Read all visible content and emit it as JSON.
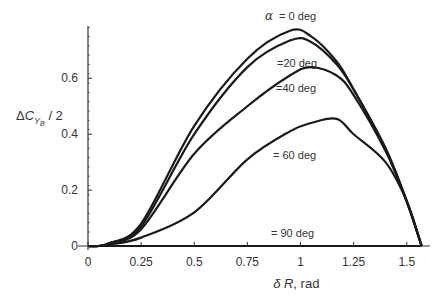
{
  "chart_data": {
    "type": "line",
    "title": "",
    "xlabel": "δR, rad",
    "ylabel": "ΔC_YB / 2",
    "xlim": [
      0,
      1.6
    ],
    "ylim": [
      0,
      0.8
    ],
    "grid": false,
    "legend": "inline curve labels",
    "x_ticks": [
      "0",
      "0.25",
      "0.5",
      "0.75",
      "1",
      "1.25",
      "1.5"
    ],
    "y_ticks": [
      "0",
      "0.2",
      "0.4",
      "0.6"
    ],
    "x": [
      0,
      0.05,
      0.1,
      0.25,
      0.5,
      0.75,
      0.95,
      1.05,
      1.17,
      1.25,
      1.4,
      1.5,
      1.57
    ],
    "series": [
      {
        "name": "α = 0 deg",
        "label": "α = 0 deg",
        "values": [
          0,
          0.0,
          0.01,
          0.08,
          0.43,
          0.67,
          0.77,
          0.75,
          0.66,
          0.56,
          0.35,
          0.16,
          0
        ]
      },
      {
        "name": "α = 20 deg",
        "label": "=20 deg",
        "values": [
          0,
          0.0,
          0.01,
          0.07,
          0.4,
          0.64,
          0.735,
          0.73,
          0.65,
          0.56,
          0.35,
          0.16,
          0
        ]
      },
      {
        "name": "α = 40 deg",
        "label": "=40 deg",
        "values": [
          0,
          0.0,
          0.01,
          0.06,
          0.33,
          0.5,
          0.61,
          0.64,
          0.61,
          0.54,
          0.34,
          0.16,
          0
        ]
      },
      {
        "name": "α = 60 deg",
        "label": "= 60 deg",
        "values": [
          0,
          0.0,
          0.005,
          0.03,
          0.12,
          0.31,
          0.41,
          0.44,
          0.455,
          0.4,
          0.3,
          0.16,
          0
        ]
      },
      {
        "name": "α = 90 deg",
        "label": "= 90 deg",
        "values": [
          0,
          0,
          0,
          0,
          0,
          0,
          0,
          0,
          0,
          0,
          0,
          0,
          0
        ]
      }
    ],
    "annotations": [
      "α = 0 deg",
      "=20 deg",
      "=40 deg",
      "= 60 deg",
      "= 90 deg"
    ]
  }
}
